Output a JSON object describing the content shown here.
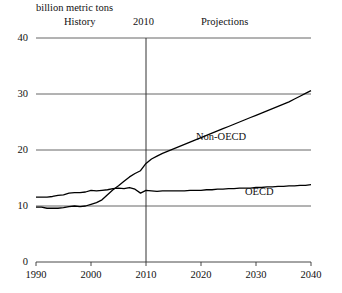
{
  "figure": {
    "unit_label": "billion metric tons",
    "era_history": "History",
    "era_divider_year": "2010",
    "era_projections": "Projections"
  },
  "chart_data": {
    "type": "line",
    "title": "",
    "subtitle": "",
    "xlabel": "",
    "ylabel": "billion metric tons",
    "xlim": [
      1990,
      2040
    ],
    "ylim": [
      0,
      40
    ],
    "yticks": [
      0,
      10,
      20,
      30,
      40
    ],
    "xticks": [
      1990,
      2000,
      2010,
      2020,
      2030,
      2040
    ],
    "grid": "horizontal",
    "legend": "inline-annotations",
    "annotations": [
      {
        "text": "History",
        "x": 1995,
        "y": 39.5
      },
      {
        "text": "2010",
        "x": 2010,
        "y": 39.5
      },
      {
        "text": "Projections",
        "x": 2025,
        "y": 39.5
      }
    ],
    "divider_x": 2010,
    "x": [
      1990,
      1991,
      1992,
      1993,
      1994,
      1995,
      1996,
      1997,
      1998,
      1999,
      2000,
      2001,
      2002,
      2003,
      2004,
      2005,
      2006,
      2007,
      2008,
      2009,
      2010,
      2011,
      2012,
      2013,
      2014,
      2015,
      2016,
      2017,
      2018,
      2019,
      2020,
      2021,
      2022,
      2023,
      2024,
      2025,
      2026,
      2027,
      2028,
      2029,
      2030,
      2031,
      2032,
      2033,
      2034,
      2035,
      2036,
      2037,
      2038,
      2039,
      2040
    ],
    "series": [
      {
        "name": "OECD",
        "color": "#000000",
        "values": [
          11.6,
          11.6,
          11.6,
          11.7,
          11.9,
          12.0,
          12.3,
          12.4,
          12.4,
          12.5,
          12.8,
          12.7,
          12.8,
          12.9,
          13.1,
          13.2,
          13.1,
          13.3,
          13.0,
          12.3,
          12.8,
          12.7,
          12.6,
          12.7,
          12.7,
          12.7,
          12.7,
          12.7,
          12.8,
          12.8,
          12.8,
          12.9,
          12.9,
          13.0,
          13.0,
          13.1,
          13.1,
          13.2,
          13.2,
          13.2,
          13.3,
          13.3,
          13.4,
          13.4,
          13.5,
          13.5,
          13.6,
          13.6,
          13.7,
          13.7,
          13.8
        ]
      },
      {
        "name": "Non-OECD",
        "color": "#000000",
        "values": [
          9.8,
          9.8,
          9.6,
          9.6,
          9.6,
          9.7,
          9.9,
          10.0,
          9.9,
          10.0,
          10.3,
          10.6,
          11.1,
          12.0,
          12.9,
          13.6,
          14.4,
          15.2,
          15.8,
          16.3,
          17.6,
          18.4,
          18.9,
          19.4,
          19.8,
          20.2,
          20.6,
          21.0,
          21.4,
          21.8,
          22.2,
          22.6,
          23.0,
          23.4,
          23.8,
          24.2,
          24.6,
          25.0,
          25.4,
          25.8,
          26.2,
          26.6,
          27.0,
          27.4,
          27.8,
          28.2,
          28.6,
          29.1,
          29.6,
          30.1,
          30.6
        ]
      }
    ]
  }
}
